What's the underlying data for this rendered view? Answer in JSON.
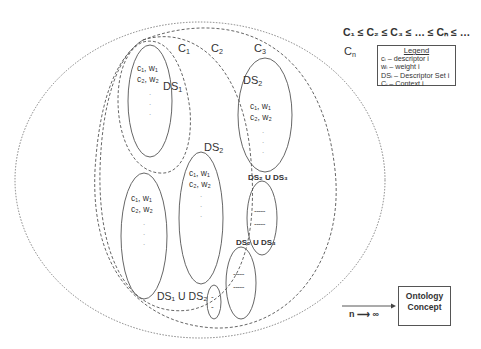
{
  "title_equation": "C₁ ≤ C₂ ≤ C₃ ≤ … ≤ Cₙ ≤ …",
  "contexts": {
    "c1": "C",
    "c1_sub": "1",
    "c2": "C",
    "c2_sub": "2",
    "c3": "C",
    "c3_sub": "3",
    "cn": "C",
    "cn_sub": "n"
  },
  "legend": {
    "title": "Legend",
    "items": [
      "cᵢ – descriptor i",
      "wᵢ – weight i",
      "DSᵢ – Descriptor Set i",
      "Cᵢ – Context i"
    ]
  },
  "descriptor_sets": {
    "ds1_label": "DS",
    "ds1_sub": "1",
    "ds2_label_top": "DS",
    "ds2_sub_top": "2",
    "ds2_label_mid": "DS",
    "ds2_sub_mid": "2",
    "ds1_u_ds2": "DS₁ U DS₂",
    "ds_u_ds_a": "DS₂ U DS₃",
    "ds_u_ds_b": "DS₂ U DS₃"
  },
  "pairs": {
    "row1": "c₁, w₁",
    "row2": "c₂, w₂"
  },
  "dots": "·\n·\n·",
  "dashes": "-----",
  "ontology_box": {
    "line1": "Ontology",
    "line2": "Concept"
  },
  "limit_label": "n ⟶ ∞",
  "colors": {
    "stroke": "#555555",
    "text": "#333333",
    "background": "#ffffff"
  }
}
